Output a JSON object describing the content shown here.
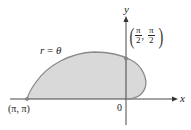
{
  "axes": {
    "x_label": "x",
    "y_label": "y",
    "origin_label": "0"
  },
  "curve": {
    "equation_lhs": "r",
    "equation_eq": "=",
    "equation_rhs": "θ",
    "fill_color": "#d9d9d9",
    "stroke_color": "#8a8a8a"
  },
  "points": [
    {
      "label": "(π, π)"
    },
    {
      "num_x": "π",
      "den_x": "2",
      "num_y": "π",
      "den_y": "2",
      "sep": ","
    }
  ],
  "colors": {
    "axis": "#333333",
    "curve": "#8a8a8a",
    "fill": "#d9d9d9"
  }
}
